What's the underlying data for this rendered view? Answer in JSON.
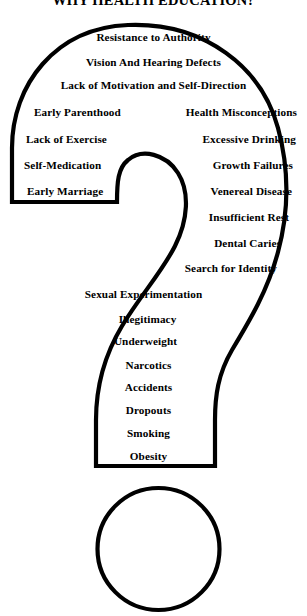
{
  "poster": {
    "title": "WHY HEALTH EDUCATION?",
    "shape": "question-mark",
    "ink_color": "#000000",
    "background_color": "#ffffff"
  },
  "items": {
    "arc_centered": [
      {
        "label": "Resistance to Authority",
        "y": 31
      },
      {
        "label": "Vision And Hearing Defects",
        "y": 56
      },
      {
        "label": "Lack of Motivation and  Self-Direction",
        "y": 79
      }
    ],
    "paired_rows": [
      {
        "left": "Early Parenthood",
        "right": "Health Misconceptions",
        "y": 106
      },
      {
        "left": "Lack of Exercise",
        "right": "Excessive Drinking",
        "y": 133
      },
      {
        "left": "Self-Medication",
        "right": "Growth Failures",
        "y": 159
      },
      {
        "left": "Early Marriage",
        "right": "Venereal Disease",
        "y": 185
      }
    ],
    "stem_right_aligned": [
      {
        "label": "Insufficient Rest",
        "y": 211
      },
      {
        "label": "Dental Caries",
        "y": 237
      },
      {
        "label": "Search for Identity",
        "y": 262
      }
    ],
    "stem_centered": [
      {
        "label": "Sexual Experimentation",
        "y": 288
      },
      {
        "label": "Illegitimacy",
        "y": 313
      },
      {
        "label": "Underweight",
        "y": 335
      },
      {
        "label": "Narcotics",
        "y": 359
      },
      {
        "label": "Accidents",
        "y": 381
      },
      {
        "label": "Dropouts",
        "y": 404
      },
      {
        "label": "Smoking",
        "y": 427
      },
      {
        "label": "Obesity",
        "y": 450
      }
    ]
  }
}
